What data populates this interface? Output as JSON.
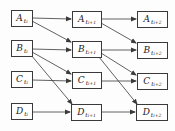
{
  "diagram": {
    "columns": [
      "t_i",
      "t_{i+1}",
      "t_{i+2}"
    ],
    "rows": [
      "A",
      "B",
      "C",
      "D"
    ],
    "nodes": {
      "a0": {
        "base": "A",
        "sub": "t",
        "subsub": "i"
      },
      "b0": {
        "base": "B",
        "sub": "t",
        "subsub": "i"
      },
      "c0": {
        "base": "C",
        "sub": "t",
        "subsub": "i"
      },
      "d0": {
        "base": "D",
        "sub": "t",
        "subsub": "i"
      },
      "a1": {
        "base": "A",
        "sub": "t",
        "subsub": "i+1"
      },
      "b1": {
        "base": "B",
        "sub": "t",
        "subsub": "i+1"
      },
      "c1": {
        "base": "C",
        "sub": "t",
        "subsub": "i+1"
      },
      "d1": {
        "base": "D",
        "sub": "t",
        "subsub": "i+1"
      },
      "a2": {
        "base": "A",
        "sub": "t",
        "subsub": "i+2"
      },
      "b2": {
        "base": "B",
        "sub": "t",
        "subsub": "i+2"
      },
      "c2": {
        "base": "C",
        "sub": "t",
        "subsub": "i+2"
      },
      "d2": {
        "base": "D",
        "sub": "t",
        "subsub": "i+2"
      }
    },
    "edges": [
      [
        "A_ti",
        "A_ti+1"
      ],
      [
        "A_ti",
        "B_ti+1"
      ],
      [
        "B_ti",
        "B_ti+1"
      ],
      [
        "B_ti",
        "C_ti+1"
      ],
      [
        "B_ti",
        "D_ti+1"
      ],
      [
        "C_ti",
        "C_ti+1"
      ],
      [
        "D_ti",
        "D_ti+1"
      ],
      [
        "A_ti+1",
        "A_ti+2"
      ],
      [
        "A_ti+1",
        "B_ti+2"
      ],
      [
        "B_ti+1",
        "B_ti+2"
      ],
      [
        "B_ti+1",
        "C_ti+2"
      ],
      [
        "B_ti+1",
        "D_ti+2"
      ],
      [
        "C_ti+1",
        "C_ti+2"
      ],
      [
        "D_ti+1",
        "D_ti+2"
      ]
    ],
    "colors": {
      "stroke": "#3a3a3a",
      "text": "#222222",
      "background": "#ffffff"
    }
  }
}
